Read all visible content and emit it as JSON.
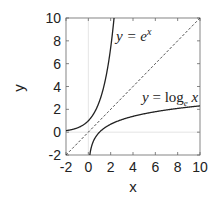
{
  "chart_data": {
    "type": "line",
    "title": "",
    "xlabel": "x",
    "ylabel": "y",
    "xlim": [
      -2,
      10
    ],
    "ylim": [
      -2,
      10
    ],
    "xticks": [
      "-2",
      "0",
      "2",
      "4",
      "6",
      "8",
      "10"
    ],
    "yticks": [
      "-2",
      "0",
      "2",
      "4",
      "6",
      "8",
      "10"
    ],
    "grid": false,
    "zero_lines": true,
    "series": [
      {
        "name": "y = e^x",
        "function": "exp",
        "style": "solid",
        "x_range": [
          -2,
          2.3026
        ]
      },
      {
        "name": "y = log_e x",
        "function": "ln",
        "style": "solid",
        "x_range": [
          0.1353,
          10
        ]
      },
      {
        "name": "y = x",
        "function": "identity",
        "style": "dashed",
        "x_range": [
          -2,
          10
        ]
      }
    ],
    "annotations": [
      {
        "text_main": "y = e",
        "text_sup": "x",
        "near": [
          3.6,
          8.2
        ]
      },
      {
        "text_main": "y = log",
        "text_sub": "e",
        "text_tail": " x",
        "near": [
          6.9,
          2.7
        ]
      }
    ]
  }
}
